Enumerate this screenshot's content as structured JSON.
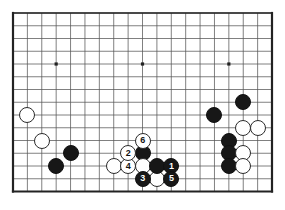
{
  "diagram": {
    "type": "go-board-diagram",
    "board_size": 19,
    "visible_columns": 19,
    "visible_rows": 15,
    "background_color": "#ffffff",
    "line_color": "#555555",
    "edge_color": "#222222",
    "black_color": "#171717",
    "white_color": "#ffffff",
    "star_points": [
      {
        "col": 3,
        "row": 4
      },
      {
        "col": 9,
        "row": 4
      },
      {
        "col": 15,
        "row": 4
      }
    ],
    "geometry": {
      "left": 13,
      "top": 13,
      "right": 272,
      "bottom": 191.5,
      "col_step": 14.39,
      "row_step": 12.75,
      "stone_size": 16
    },
    "stones": [
      {
        "id": "w-left-upper",
        "color": "white",
        "col": 1,
        "row": 8,
        "label": ""
      },
      {
        "id": "w-left-lower",
        "color": "white",
        "col": 2,
        "row": 10,
        "label": ""
      },
      {
        "id": "b-low-left",
        "color": "black",
        "col": 3,
        "row": 12,
        "label": ""
      },
      {
        "id": "b-low-left-2",
        "color": "black",
        "col": 4,
        "row": 11,
        "label": ""
      },
      {
        "id": "w-center-low",
        "color": "white",
        "col": 7,
        "row": 12,
        "label": ""
      },
      {
        "id": "move-4",
        "color": "white",
        "col": 8,
        "row": 12,
        "label": "4"
      },
      {
        "id": "move-2",
        "color": "white",
        "col": 8,
        "row": 11,
        "label": "2"
      },
      {
        "id": "move-6",
        "color": "white",
        "col": 9,
        "row": 10,
        "label": "6"
      },
      {
        "id": "b-contact",
        "color": "black",
        "col": 9,
        "row": 11,
        "label": ""
      },
      {
        "id": "w-below-6",
        "color": "white",
        "col": 9,
        "row": 12,
        "label": ""
      },
      {
        "id": "move-3",
        "color": "black",
        "col": 9,
        "row": 13,
        "label": "3"
      },
      {
        "id": "w-bottom-mid",
        "color": "white",
        "col": 10,
        "row": 13,
        "label": ""
      },
      {
        "id": "b-right-low",
        "color": "black",
        "col": 10,
        "row": 12,
        "label": ""
      },
      {
        "id": "move-1",
        "color": "black",
        "col": 11,
        "row": 12,
        "label": "1"
      },
      {
        "id": "move-5",
        "color": "black",
        "col": 11,
        "row": 13,
        "label": "5"
      },
      {
        "id": "b-right-top",
        "color": "black",
        "col": 16,
        "row": 7,
        "label": ""
      },
      {
        "id": "b-right-up",
        "color": "black",
        "col": 14,
        "row": 8,
        "label": ""
      },
      {
        "id": "w-right-a",
        "color": "white",
        "col": 16,
        "row": 9,
        "label": ""
      },
      {
        "id": "w-right-b",
        "color": "white",
        "col": 17,
        "row": 9,
        "label": ""
      },
      {
        "id": "b-right-1",
        "color": "black",
        "col": 15,
        "row": 10,
        "label": ""
      },
      {
        "id": "b-right-2",
        "color": "black",
        "col": 15,
        "row": 11,
        "label": ""
      },
      {
        "id": "b-right-3",
        "color": "black",
        "col": 15,
        "row": 12,
        "label": ""
      },
      {
        "id": "w-right-c",
        "color": "white",
        "col": 16,
        "row": 11,
        "label": ""
      },
      {
        "id": "w-right-d",
        "color": "white",
        "col": 16,
        "row": 12,
        "label": ""
      }
    ],
    "move_numbers": [
      "1",
      "2",
      "3",
      "4",
      "5",
      "6"
    ]
  }
}
